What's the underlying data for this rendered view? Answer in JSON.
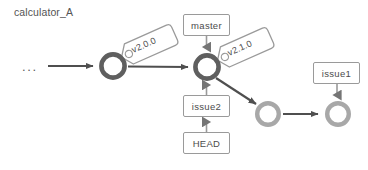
{
  "diagram": {
    "repo_label": "calculator_A",
    "ellipsis": "...",
    "caption": "",
    "colors": {
      "commit_dark": "#5f5f5f",
      "commit_light": "#a8a8a8",
      "arrow": "#4f4f4f",
      "box_border": "#9a9a9a",
      "tag_border": "#9a9a9a",
      "text": "#4c4c4c",
      "background": "#ffffff"
    },
    "commits": [
      {
        "id": "commit-1",
        "style": "dark",
        "cx": 113,
        "cy": 66,
        "r_outer": 14,
        "r_inner": 9
      },
      {
        "id": "commit-2",
        "style": "dark",
        "cx": 207,
        "cy": 67,
        "r_outer": 14,
        "r_inner": 9
      },
      {
        "id": "commit-3",
        "style": "light",
        "cx": 268,
        "cy": 114,
        "r_outer": 13,
        "r_inner": 8.5
      },
      {
        "id": "commit-4",
        "style": "light",
        "cx": 338,
        "cy": 114,
        "r_outer": 13,
        "r_inner": 8.5
      }
    ],
    "tags": [
      {
        "id": "tag-v200",
        "label": "v2.0.0",
        "x": 123,
        "y": 34,
        "w": 52,
        "h": 22,
        "rotate": -24
      },
      {
        "id": "tag-v210",
        "label": "v2.1.0",
        "x": 219,
        "y": 37,
        "w": 52,
        "h": 22,
        "rotate": -24
      }
    ],
    "refs": [
      {
        "id": "ref-master",
        "label": "master",
        "left": 183,
        "top": 14,
        "width": 47,
        "height": 22
      },
      {
        "id": "ref-issue2",
        "label": "issue2",
        "left": 183,
        "top": 95,
        "width": 47,
        "height": 22
      },
      {
        "id": "ref-head",
        "label": "HEAD",
        "left": 183,
        "top": 132,
        "width": 47,
        "height": 22
      },
      {
        "id": "ref-issue1",
        "label": "issue1",
        "left": 313,
        "top": 62,
        "width": 47,
        "height": 22
      }
    ],
    "edges": [
      {
        "id": "edge-ellipsis-to-commit1",
        "from": "ellipsis",
        "to": "commit-1"
      },
      {
        "id": "edge-commit1-to-commit2",
        "from": "commit-1",
        "to": "commit-2"
      },
      {
        "id": "edge-commit2-to-commit3",
        "from": "commit-2",
        "to": "commit-3"
      },
      {
        "id": "edge-commit3-to-commit4",
        "from": "commit-3",
        "to": "commit-4"
      },
      {
        "id": "edge-master-to-commit2",
        "from": "ref-master",
        "to": "commit-2"
      },
      {
        "id": "edge-issue2-to-commit2",
        "from": "ref-issue2",
        "to": "commit-2"
      },
      {
        "id": "edge-head-to-issue2",
        "from": "ref-head",
        "to": "ref-issue2"
      },
      {
        "id": "edge-issue1-to-commit4",
        "from": "ref-issue1",
        "to": "commit-4"
      }
    ]
  }
}
